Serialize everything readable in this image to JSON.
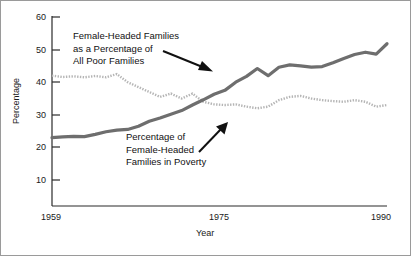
{
  "chart_data": {
    "type": "line",
    "title": "",
    "xlabel": "Year",
    "ylabel": "Percentage",
    "xlim": [
      1959,
      1990
    ],
    "ylim": [
      0,
      60
    ],
    "yticks": [
      10,
      20,
      30,
      40,
      50,
      60
    ],
    "xticks": [
      1959,
      1975,
      1990
    ],
    "xtick_labels": [
      "1959",
      "1975",
      "1990"
    ],
    "ytick_labels": [
      "10",
      "20",
      "30",
      "40",
      "50",
      "60"
    ],
    "grid": false,
    "legend": "none (inline annotations with arrows)",
    "x": [
      1959,
      1960,
      1961,
      1962,
      1963,
      1964,
      1965,
      1966,
      1967,
      1968,
      1969,
      1970,
      1971,
      1972,
      1973,
      1974,
      1975,
      1976,
      1977,
      1978,
      1979,
      1980,
      1981,
      1982,
      1983,
      1984,
      1985,
      1986,
      1987,
      1988,
      1989,
      1990
    ],
    "series": [
      {
        "name": "Female-Headed Families as a Percentage of All Poor Families",
        "color": "#6e6e6e",
        "style": "solid-thick",
        "values": [
          23.0,
          23.2,
          23.4,
          23.3,
          24.0,
          24.8,
          25.3,
          25.5,
          26.5,
          28.0,
          29.0,
          30.2,
          31.3,
          33.0,
          34.6,
          36.3,
          37.5,
          40.0,
          41.8,
          44.2,
          42.0,
          44.6,
          45.3,
          45.0,
          44.6,
          44.8,
          46.0,
          47.3,
          48.5,
          49.2,
          48.6,
          51.8
        ]
      },
      {
        "name": "Percentage of Female-Headed Families in Poverty",
        "color": "#b5b5b5",
        "style": "dotted-thin",
        "values": [
          42.0,
          41.6,
          41.8,
          41.5,
          41.9,
          41.5,
          42.5,
          40.0,
          38.5,
          37.0,
          35.5,
          36.5,
          35.0,
          36.5,
          34.0,
          33.2,
          33.0,
          33.2,
          32.5,
          32.0,
          32.5,
          34.5,
          35.5,
          35.8,
          35.0,
          34.5,
          34.2,
          34.0,
          34.5,
          34.0,
          32.5,
          33.0
        ]
      }
    ],
    "annotations": [
      {
        "id": "annot-female-headed-share",
        "lines": [
          "Female-Headed Families",
          "as a Percentage of",
          "All Poor Families"
        ],
        "points_to": "Female-Headed Families as a Percentage of All Poor Families"
      },
      {
        "id": "annot-poverty-rate",
        "lines": [
          "Percentage of",
          "Female-Headed",
          "Families in Poverty"
        ],
        "points_to": "Percentage of Female-Headed Families in Poverty"
      }
    ]
  },
  "axes": {
    "ylabel": "Percentage",
    "xlabel": "Year",
    "ytick_labels": [
      "60",
      "50",
      "40",
      "30",
      "20",
      "10"
    ],
    "xtick_labels": [
      "1959",
      "1975",
      "1990"
    ]
  },
  "annotations": {
    "one": {
      "l1": "Female-Headed Families",
      "l2": "as a Percentage of",
      "l3": "All Poor Families"
    },
    "two": {
      "l1": "Percentage of",
      "l2": "Female-Headed",
      "l3": "Families in Poverty"
    }
  },
  "colors": {
    "series_thick": "#6e6e6e",
    "series_dotted": "#b5b5b5",
    "axis": "#2b2b2b",
    "frame": "#9a9a9a"
  }
}
